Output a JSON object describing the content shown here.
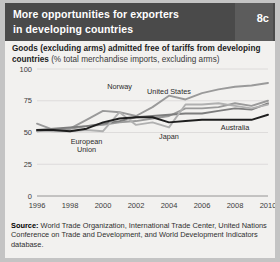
{
  "header": {
    "title_line1": "More opportunities for exporters",
    "title_line2": "in developing countries",
    "badge": "8c"
  },
  "subtitle": {
    "bold": "Goods (excluding arms) admitted free of tariffs from developing countries ",
    "normal": "(% total merchandise imports, excluding arms)"
  },
  "source": {
    "label": "Source:",
    "text": " World Trade Organization, International Trade Center, United Nations Conference on Trade and Development, and World Development Indicators database."
  },
  "colors": {
    "header_bg": "#4a4a4a",
    "card_bg": "#f2f1ef",
    "page_bg": "#c4c4c4",
    "norway": "#9a9a9a",
    "united_states": "#9a9a9a",
    "european_union": "#7d7d7d",
    "japan": "#b0b0b0",
    "australia": "#1e1e1e",
    "grid": "#d8d7d5",
    "axis": "#8a8a8a"
  },
  "chart_data": {
    "type": "line",
    "title": "Goods (excluding arms) admitted free of tariffs from developing countries",
    "xlabel": "",
    "ylabel": "% total merchandise imports, excluding arms",
    "x": [
      1996,
      1997,
      1998,
      1999,
      2000,
      2001,
      2002,
      2003,
      2004,
      2005,
      2006,
      2007,
      2008,
      2009,
      2010
    ],
    "xticks": [
      1996,
      1998,
      2000,
      2002,
      2004,
      2006,
      2008,
      2010
    ],
    "yticks": [
      0,
      25,
      50,
      75,
      100
    ],
    "ylim": [
      0,
      100
    ],
    "xlim": [
      1996,
      2010
    ],
    "grid": true,
    "legend": "inline-annotations",
    "series": [
      {
        "name": "Norway",
        "color": "#9a9a9a",
        "label_x": 2001,
        "label_y": 84,
        "values": [
          57,
          52,
          53,
          60,
          67,
          66,
          63,
          70,
          79,
          76,
          81,
          84,
          86,
          87,
          89
        ]
      },
      {
        "name": "United States",
        "color": "#9a9a9a",
        "label_x": 2004,
        "label_y": 80,
        "values": [
          51,
          52,
          53,
          55,
          56,
          58,
          59,
          61,
          63,
          69,
          69,
          70,
          73,
          71,
          75
        ]
      },
      {
        "name": "European Union",
        "color": "#7d7d7d",
        "label_x": 1999,
        "label_y": 41,
        "values": [
          52,
          53,
          54,
          55,
          57,
          59,
          62,
          63,
          64,
          65,
          65,
          67,
          69,
          68,
          73
        ]
      },
      {
        "name": "Japan",
        "color": "#b0b0b0",
        "label_x": 2004,
        "label_y": 45,
        "values": [
          52,
          51,
          51,
          52,
          51,
          66,
          56,
          58,
          54,
          72,
          72,
          73,
          71,
          69,
          72
        ]
      },
      {
        "name": "Australia",
        "color": "#1e1e1e",
        "label_x": 2008,
        "label_y": 52,
        "values": [
          52,
          52,
          51,
          53,
          58,
          61,
          62,
          62,
          58,
          59,
          60,
          60,
          60,
          60,
          64
        ]
      }
    ]
  }
}
